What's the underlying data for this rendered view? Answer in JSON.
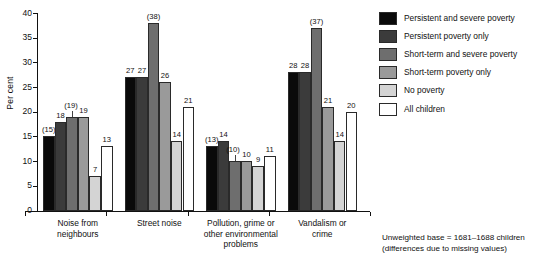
{
  "chart_data": {
    "type": "bar",
    "title": "",
    "xlabel": "",
    "ylabel": "Per cent",
    "ylim": [
      0,
      40
    ],
    "ytick_step": 5,
    "ytick_labels": [
      "0",
      "5",
      "10",
      "15",
      "20",
      "25",
      "30",
      "35",
      "40"
    ],
    "grid": false,
    "legend_position": "right",
    "categories": [
      "Noise from neighbours",
      "Street noise",
      "Pollution, grime or other environmental problems",
      "Vandalism or crime"
    ],
    "category_lines": [
      [
        "Noise from",
        "neighbours"
      ],
      [
        "Street noise"
      ],
      [
        "Pollution, grime or",
        "other environmental",
        "problems"
      ],
      [
        "Vandalism or",
        "crime"
      ]
    ],
    "series": [
      {
        "name": "Persistent and severe poverty",
        "color": "#0a0a0a",
        "values": [
          15,
          27,
          13,
          28
        ],
        "labels": [
          "(15)",
          "27",
          "(13)",
          "28"
        ]
      },
      {
        "name": "Persistent poverty only",
        "color": "#3b3b3b",
        "values": [
          18,
          27,
          14,
          28
        ],
        "labels": [
          "18",
          "27",
          "14",
          "28"
        ]
      },
      {
        "name": "Short-term and severe poverty",
        "color": "#6e6e6e",
        "values": [
          19,
          38,
          10,
          37
        ],
        "labels": [
          "(19)",
          "(38)",
          "(10)",
          "(37)"
        ]
      },
      {
        "name": "Short-term poverty only",
        "color": "#9a9a9a",
        "values": [
          19,
          26,
          10,
          21
        ],
        "labels": [
          "19",
          "26",
          "10",
          "21"
        ]
      },
      {
        "name": "No poverty",
        "color": "#d4d4d4",
        "values": [
          7,
          14,
          9,
          14
        ],
        "labels": [
          "7",
          "14",
          "9",
          "14"
        ]
      },
      {
        "name": "All children",
        "color": "#ffffff",
        "values": [
          13,
          21,
          11,
          20
        ],
        "labels": [
          "13",
          "21",
          "11",
          "20"
        ]
      }
    ]
  },
  "legend": {
    "items": [
      {
        "label": "Persistent and severe poverty",
        "color": "#0a0a0a"
      },
      {
        "label": "Persistent poverty only",
        "color": "#3b3b3b"
      },
      {
        "label": "Short-term and severe poverty",
        "color": "#6e6e6e"
      },
      {
        "label": "Short-term poverty only",
        "color": "#9a9a9a"
      },
      {
        "label": "No poverty",
        "color": "#d4d4d4"
      },
      {
        "label": "All children",
        "color": "#ffffff"
      }
    ]
  },
  "footnote": {
    "line1": "Unweighted base = 1681–1688 children",
    "line2": "(differences due to missing values)"
  }
}
